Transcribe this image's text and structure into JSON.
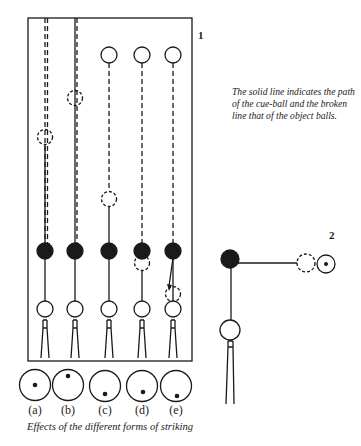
{
  "figure1": {
    "number": "1",
    "columns": [
      "a",
      "b",
      "c",
      "d",
      "e"
    ]
  },
  "figure2": {
    "number": "2"
  },
  "legend_note": "The solid line indicates the path of the cue-ball and the broken line that of the object balls.",
  "strike_labels": [
    "(a)",
    "(b)",
    "(c)",
    "(d)",
    "(e)"
  ],
  "caption": "Effects of the different forms of striking",
  "colors": {
    "ink": "#1a1a1a",
    "paper": "#ffffff"
  }
}
